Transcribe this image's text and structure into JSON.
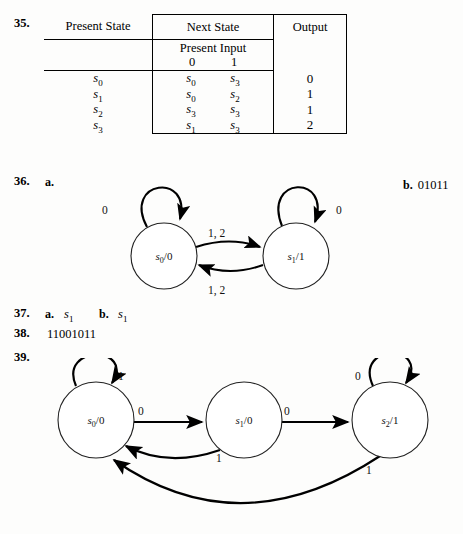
{
  "page": {
    "background": "#fdfdfc",
    "ink": "#000000"
  },
  "problem35": {
    "number": "35.",
    "table": {
      "headers": {
        "present_state": "Present State",
        "next_state": "Next State",
        "output": "Output",
        "present_input": "Present Input",
        "input_0": "0",
        "input_1": "1"
      },
      "rows": [
        {
          "state": "s",
          "state_sub": "0",
          "next0": "s",
          "next0_sub": "0",
          "next1": "s",
          "next1_sub": "3",
          "output": "0"
        },
        {
          "state": "s",
          "state_sub": "1",
          "next0": "s",
          "next0_sub": "0",
          "next1": "s",
          "next1_sub": "2",
          "output": "1"
        },
        {
          "state": "s",
          "state_sub": "2",
          "next0": "s",
          "next0_sub": "3",
          "next1": "s",
          "next1_sub": "3",
          "output": "1"
        },
        {
          "state": "s",
          "state_sub": "3",
          "next0": "s",
          "next0_sub": "1",
          "next1": "s",
          "next1_sub": "3",
          "output": "2"
        }
      ]
    }
  },
  "problem36": {
    "number": "36.",
    "part_a_label": "a.",
    "part_b_label": "b.",
    "part_b_answer": "01011",
    "diagram": {
      "type": "state-transition-diagram",
      "nodes": [
        {
          "id": "s0",
          "label_base": "s",
          "label_sub": "0",
          "label_suffix": "/0",
          "cx": 120,
          "cy": 82,
          "r": 33
        },
        {
          "id": "s1",
          "label_base": "s",
          "label_sub": "1",
          "label_suffix": "/1",
          "cx": 252,
          "cy": 82,
          "r": 33
        }
      ],
      "edges": [
        {
          "from": "s0",
          "to": "s0",
          "label": "0",
          "kind": "self-loop",
          "label_x": 60,
          "label_y": 36
        },
        {
          "from": "s1",
          "to": "s1",
          "label": "0",
          "kind": "self-loop",
          "label_x": 300,
          "label_y": 36
        },
        {
          "from": "s0",
          "to": "s1",
          "label": "1, 2",
          "kind": "curve-top",
          "label_x": 171,
          "label_y": 66
        },
        {
          "from": "s1",
          "to": "s0",
          "label": "1, 2",
          "kind": "curve-bottom",
          "label_x": 171,
          "label_y": 122
        }
      ]
    }
  },
  "problem37": {
    "number": "37.",
    "part_a_label": "a.",
    "part_a_answer_base": "s",
    "part_a_answer_sub": "1",
    "part_b_label": "b.",
    "part_b_answer_base": "s",
    "part_b_answer_sub": "1"
  },
  "problem38": {
    "number": "38.",
    "answer": "11001011"
  },
  "problem39": {
    "number": "39.",
    "diagram": {
      "type": "state-transition-diagram",
      "nodes": [
        {
          "id": "s0",
          "label_base": "s",
          "label_sub": "0",
          "label_suffix": "/0",
          "cx": 68,
          "cy": 62,
          "r": 38
        },
        {
          "id": "s1",
          "label_base": "s",
          "label_sub": "1",
          "label_suffix": "/0",
          "cx": 216,
          "cy": 62,
          "r": 38
        },
        {
          "id": "s2",
          "label_base": "s",
          "label_sub": "2",
          "label_suffix": "/1",
          "cx": 362,
          "cy": 62,
          "r": 38
        }
      ],
      "edges": [
        {
          "from": "s0",
          "to": "s0",
          "label": "1",
          "kind": "self-loop",
          "label_x": 93,
          "label_y": 22
        },
        {
          "from": "s2",
          "to": "s2",
          "label": "0",
          "kind": "self-loop",
          "label_x": 331,
          "label_y": 22
        },
        {
          "from": "s0",
          "to": "s1",
          "label": "0",
          "kind": "straight",
          "label_x": 112,
          "label_y": 55
        },
        {
          "from": "s1",
          "to": "s2",
          "label": "0",
          "kind": "straight",
          "label_x": 258,
          "label_y": 55
        },
        {
          "from": "s1",
          "to": "s0",
          "label": "1",
          "kind": "curve-bottom-short",
          "label_x": 190,
          "label_y": 100
        },
        {
          "from": "s2",
          "to": "s0",
          "label": "1",
          "kind": "curve-bottom-long",
          "label_x": 340,
          "label_y": 110
        }
      ]
    }
  }
}
